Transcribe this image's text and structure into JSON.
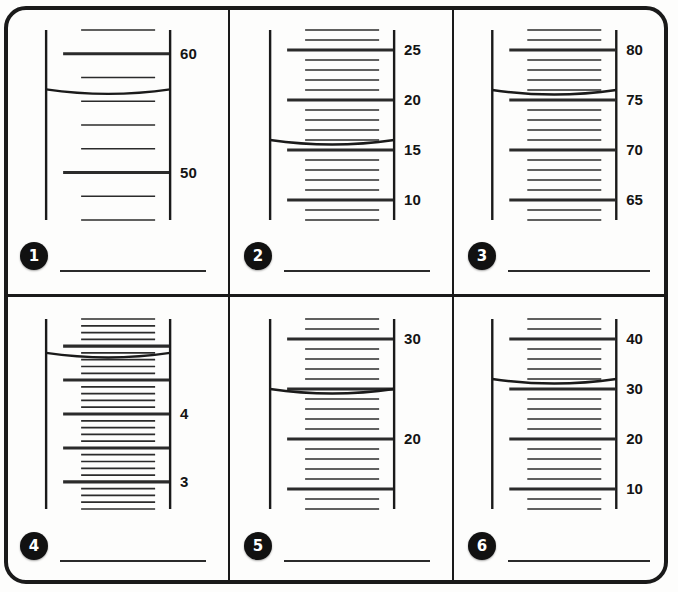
{
  "worksheet": {
    "title": "Reading Graduated Cylinders",
    "panel_count": 6
  },
  "panels": [
    {
      "number": "1",
      "badge_label": "1",
      "answer_line": true,
      "labels": [
        "60",
        "50"
      ],
      "cylinder": {
        "scale_max": 62,
        "scale_min": 46,
        "major_interval": 10,
        "minor_per_major": 5,
        "meniscus_value": 57,
        "labeled_values": [
          60,
          50
        ]
      }
    },
    {
      "number": "2",
      "badge_label": "2",
      "answer_line": true,
      "labels": [
        "25",
        "20",
        "15",
        "10"
      ],
      "cylinder": {
        "scale_max": 27,
        "scale_min": 8,
        "major_interval": 5,
        "minor_per_major": 5,
        "meniscus_value": 16,
        "labeled_values": [
          25,
          20,
          15,
          10
        ]
      }
    },
    {
      "number": "3",
      "badge_label": "3",
      "answer_line": true,
      "labels": [
        "80",
        "75",
        "70",
        "65"
      ],
      "cylinder": {
        "scale_max": 82,
        "scale_min": 63,
        "major_interval": 5,
        "minor_per_major": 5,
        "meniscus_value": 76,
        "labeled_values": [
          80,
          75,
          70,
          65
        ]
      }
    },
    {
      "number": "4",
      "badge_label": "4",
      "answer_line": true,
      "labels": [
        "4",
        "3"
      ],
      "cylinder": {
        "scale_max": 5.4,
        "scale_min": 2.6,
        "major_interval": 0.5,
        "minor_per_major": 5,
        "meniscus_value": 4.9,
        "labeled_values": [
          4,
          3
        ]
      }
    },
    {
      "number": "5",
      "badge_label": "5",
      "answer_line": true,
      "labels": [
        "30",
        "20"
      ],
      "cylinder": {
        "scale_max": 32,
        "scale_min": 13,
        "major_interval": 5,
        "minor_per_major": 5,
        "meniscus_value": 25,
        "labeled_values": [
          30,
          20
        ]
      }
    },
    {
      "number": "6",
      "badge_label": "6",
      "answer_line": true,
      "labels": [
        "40",
        "30",
        "20",
        "10"
      ],
      "cylinder": {
        "scale_max": 44,
        "scale_min": 6,
        "major_interval": 10,
        "minor_per_major": 5,
        "meniscus_value": 32,
        "labeled_values": [
          40,
          30,
          20,
          10
        ]
      }
    }
  ],
  "colors": {
    "ink": "#1a1a1a",
    "tick": "#2b2b2b",
    "badge_bg": "#111111",
    "badge_text": "#ffffff",
    "paper": "#fdfdfc"
  }
}
